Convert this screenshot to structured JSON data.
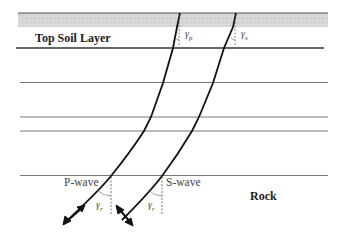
{
  "diagram": {
    "layers": {
      "top_label": "Top Soil Layer",
      "bottom_label": "Rock"
    },
    "waves": {
      "p_label": "P-wave",
      "s_label": "S-wave"
    },
    "angles": {
      "p_top_symbol": "γ",
      "p_top_sub": "p",
      "s_top_symbol": "γ",
      "s_top_sub": "s",
      "p_bottom_symbol": "γ",
      "p_bottom_sub": "r",
      "s_bottom_symbol": "γ",
      "s_bottom_sub": "r"
    },
    "colors": {
      "surface_fill": "#d9d9d9",
      "line": "#444444",
      "ray": "#111111"
    }
  }
}
